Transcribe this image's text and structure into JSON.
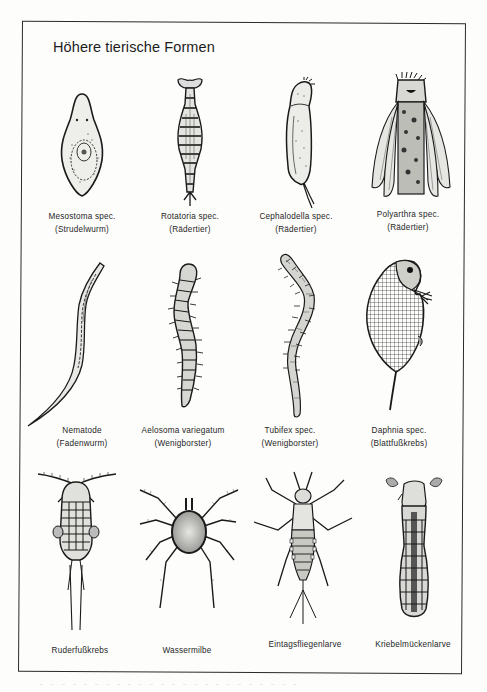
{
  "page": {
    "title": "Höhere tierische Formen",
    "rows": [
      [
        {
          "name": "Mesostoma spec.",
          "common": "(Strudelwurm)",
          "icon": "flatworm-illustration"
        },
        {
          "name": "Rotatoria spec.",
          "common": "(Rädertier)",
          "icon": "rotifer-illustration"
        },
        {
          "name": "Cephalodella spec.",
          "common": "(Rädertier)",
          "icon": "rotifer-cephalodella-illustration"
        },
        {
          "name": "Polyarthra spec.",
          "common": "(Rädertier)",
          "icon": "rotifer-polyarthra-illustration"
        }
      ],
      [
        {
          "name": "Nematode",
          "common": "(Fadenwurm)",
          "icon": "nematode-illustration"
        },
        {
          "name": "Aelosoma variegatum",
          "common": "(Wenigborster)",
          "icon": "aelosoma-worm-illustration"
        },
        {
          "name": "Tubifex spec.",
          "common": "(Wenigborster)",
          "icon": "tubifex-worm-illustration"
        },
        {
          "name": "Daphnia spec.",
          "common": "(Blattfußkrebs)",
          "icon": "daphnia-illustration"
        }
      ],
      [
        {
          "name": "Ruderfußkrebs",
          "common": "",
          "icon": "copepod-illustration"
        },
        {
          "name": "Wassermilbe",
          "common": "",
          "icon": "water-mite-illustration"
        },
        {
          "name": "Eintagsfliegenlarve",
          "common": "",
          "icon": "mayfly-larva-illustration"
        },
        {
          "name": "Kriebelmückenlarve",
          "common": "",
          "icon": "blackfly-larva-illustration"
        }
      ]
    ]
  },
  "colors": {
    "ink": "#1a1a1a",
    "paper": "#fdfdfc"
  }
}
